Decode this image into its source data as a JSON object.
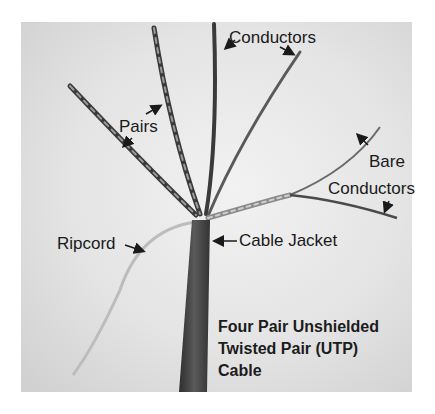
{
  "figure": {
    "title_lines": [
      "Four Pair Unshielded",
      "Twisted Pair (UTP)",
      "Cable"
    ],
    "labels": {
      "conductors": "Conductors",
      "pairs": "Pairs",
      "bare_line1": "Bare",
      "bare_line2": "Conductors",
      "ripcord": "Ripcord",
      "cable_jacket": "Cable Jacket"
    }
  }
}
